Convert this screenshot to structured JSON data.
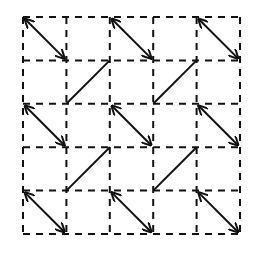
{
  "diagram": {
    "title": "",
    "grid": {
      "rows": 5,
      "cols": 5,
      "line_style": "dashed",
      "color": "#111111"
    },
    "diagonals": [
      {
        "row": 0,
        "col": 0,
        "direction": "down-right",
        "arrowheads": "both"
      },
      {
        "row": 0,
        "col": 2,
        "direction": "down-right",
        "arrowheads": "both"
      },
      {
        "row": 0,
        "col": 4,
        "direction": "down-right",
        "arrowheads": "both"
      },
      {
        "row": 1,
        "col": 1,
        "direction": "up-right",
        "arrowheads": "none"
      },
      {
        "row": 1,
        "col": 3,
        "direction": "up-right",
        "arrowheads": "none"
      },
      {
        "row": 2,
        "col": 0,
        "direction": "down-right",
        "arrowheads": "both"
      },
      {
        "row": 2,
        "col": 2,
        "direction": "down-right",
        "arrowheads": "both"
      },
      {
        "row": 2,
        "col": 4,
        "direction": "down-right",
        "arrowheads": "both"
      },
      {
        "row": 3,
        "col": 1,
        "direction": "up-right",
        "arrowheads": "none"
      },
      {
        "row": 3,
        "col": 3,
        "direction": "up-right",
        "arrowheads": "none"
      },
      {
        "row": 4,
        "col": 0,
        "direction": "down-right",
        "arrowheads": "both"
      },
      {
        "row": 4,
        "col": 2,
        "direction": "down-right",
        "arrowheads": "both"
      },
      {
        "row": 4,
        "col": 4,
        "direction": "down-right",
        "arrowheads": "both"
      }
    ]
  }
}
